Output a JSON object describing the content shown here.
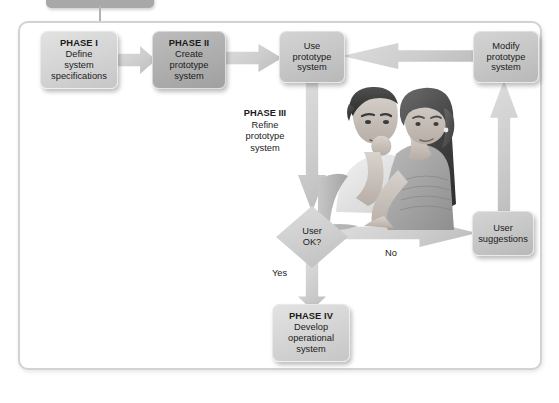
{
  "diagram": {
    "top_tab": {
      "name": "section-tab",
      "label": ""
    },
    "colors": {
      "frame_border": "#d2d2d2",
      "box_light": "#d6d6d6",
      "box_mid": "#c8c8c8",
      "box_dark": "#b0b0b0",
      "arrow_fill": "#cdcdcd",
      "text": "#1b1b1b"
    },
    "nodes": {
      "phase1": {
        "header": "PHASE I",
        "line1": "Define",
        "line2": "system",
        "line3": "specifications"
      },
      "phase2": {
        "header": "PHASE II",
        "line1": "Create",
        "line2": "prototype",
        "line3": "system"
      },
      "use_prototype": {
        "line1": "Use",
        "line2": "prototype",
        "line3": "system"
      },
      "modify_prototype": {
        "line1": "Modify",
        "line2": "prototype",
        "line3": "system"
      },
      "user_suggestions": {
        "line1": "User",
        "line2": "suggestions"
      },
      "decision": {
        "line1": "User",
        "line2": "OK?"
      },
      "phase4": {
        "header": "PHASE IV",
        "line1": "Develop",
        "line2": "operational",
        "line3": "system"
      }
    },
    "phase3": {
      "header": "PHASE III",
      "line1": "Refine",
      "line2": "prototype",
      "line3": "system"
    },
    "edge_labels": {
      "no": "No",
      "yes": "Yes"
    },
    "illustration": {
      "name": "two-users-reviewing-illustration",
      "description": "Illustration of a man and a woman studying a computer screen"
    }
  }
}
